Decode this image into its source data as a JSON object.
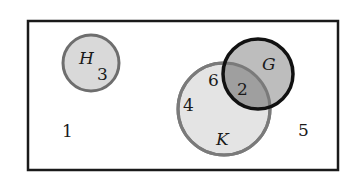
{
  "diagram": {
    "type": "venn",
    "universe": {
      "region_label": "1"
    },
    "sets": [
      {
        "name": "H",
        "fill": "#d9d9d9",
        "stroke": "#6e6e6e"
      },
      {
        "name": "K",
        "fill": "#e4e4e4",
        "stroke": "#7a7a7a"
      },
      {
        "name": "G",
        "fill": "#bdbdbd",
        "stroke": "#111111"
      }
    ],
    "regions": {
      "outside": "1",
      "outside_right": "5",
      "h_only": "3",
      "k_only_upper": "6",
      "k_only_left": "4",
      "k_and_g": "2"
    },
    "intersection_fill": "#9f9f9f"
  }
}
